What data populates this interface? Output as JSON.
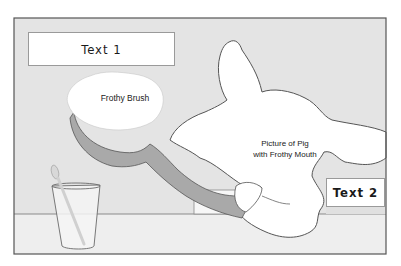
{
  "diagram": {
    "type": "illustration-storyboard-frame",
    "colors": {
      "background": "#e6e6e6",
      "floor": "#ededed",
      "frame_border": "#555555",
      "brush_handle": "#a8a8a8",
      "foam": "#ffffff",
      "pig": "#ffffff"
    },
    "text_boxes": [
      {
        "id": "text1",
        "label": "Text 1"
      },
      {
        "id": "text2",
        "label": "Text 2"
      }
    ],
    "annotations": {
      "brush": "Frothy Brush",
      "pig_line1": "Picture of Pig",
      "pig_line2": "with Frothy Mouth"
    },
    "objects": [
      "frothy-brush",
      "pig",
      "cup-with-spoon",
      "table-floor"
    ]
  }
}
